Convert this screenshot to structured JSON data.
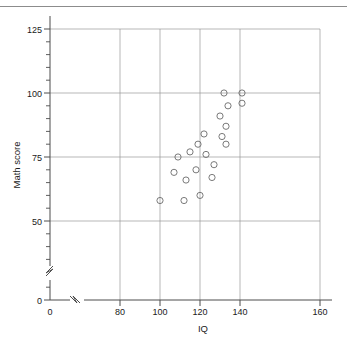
{
  "chart_data": {
    "type": "scatter",
    "title": "",
    "xlabel": "IQ",
    "ylabel": "Math score",
    "xlim": [
      0,
      160
    ],
    "ylim": [
      0,
      125
    ],
    "grid": true,
    "legend": false,
    "axis_break_x": true,
    "axis_break_y": true,
    "x_ticks": [
      0,
      80,
      100,
      120,
      140,
      160
    ],
    "x_tick_labels": [
      "0",
      "80",
      "100",
      "120",
      "140",
      "160"
    ],
    "y_ticks": [
      0,
      50,
      75,
      100,
      125
    ],
    "y_tick_labels": [
      "0",
      "50",
      "75",
      "100",
      "125"
    ],
    "y_minor_step": 5,
    "marker": "open-circle",
    "marker_color": "#6b6b6b",
    "points": [
      {
        "x": 100,
        "y": 58
      },
      {
        "x": 107,
        "y": 69
      },
      {
        "x": 109,
        "y": 75
      },
      {
        "x": 112,
        "y": 58
      },
      {
        "x": 113,
        "y": 66
      },
      {
        "x": 115,
        "y": 77
      },
      {
        "x": 118,
        "y": 70
      },
      {
        "x": 119,
        "y": 80
      },
      {
        "x": 120,
        "y": 60
      },
      {
        "x": 122,
        "y": 84
      },
      {
        "x": 123,
        "y": 76
      },
      {
        "x": 126,
        "y": 67
      },
      {
        "x": 127,
        "y": 72
      },
      {
        "x": 130,
        "y": 91
      },
      {
        "x": 131,
        "y": 83
      },
      {
        "x": 132,
        "y": 100
      },
      {
        "x": 133,
        "y": 87
      },
      {
        "x": 133,
        "y": 80
      },
      {
        "x": 134,
        "y": 95
      },
      {
        "x": 141,
        "y": 100
      },
      {
        "x": 141,
        "y": 96
      }
    ]
  },
  "axes": {
    "x_title": "IQ",
    "y_title": "Math score"
  },
  "x_labels": [
    "0",
    "80",
    "100",
    "120",
    "140",
    "160"
  ],
  "y_labels": [
    "0",
    "50",
    "75",
    "100",
    "125"
  ]
}
